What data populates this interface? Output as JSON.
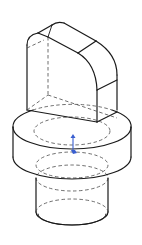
{
  "figure": {
    "type": "isometric-technical-drawing",
    "line_styles": {
      "visible_edge_color": "#1a1a1a",
      "hidden_edge_color": "#4a4a4a",
      "axis_marker_color": "#3a5fd0"
    },
    "components": [
      {
        "name": "rounded-tab",
        "description": "upright slab with rounded top edge"
      },
      {
        "name": "flange-cylinder",
        "description": "large short cylinder"
      },
      {
        "name": "shank-cylinder",
        "description": "smaller cylinder below flange"
      },
      {
        "name": "origin-axis-marker",
        "description": "blue vertical axis indicator at center"
      }
    ]
  }
}
